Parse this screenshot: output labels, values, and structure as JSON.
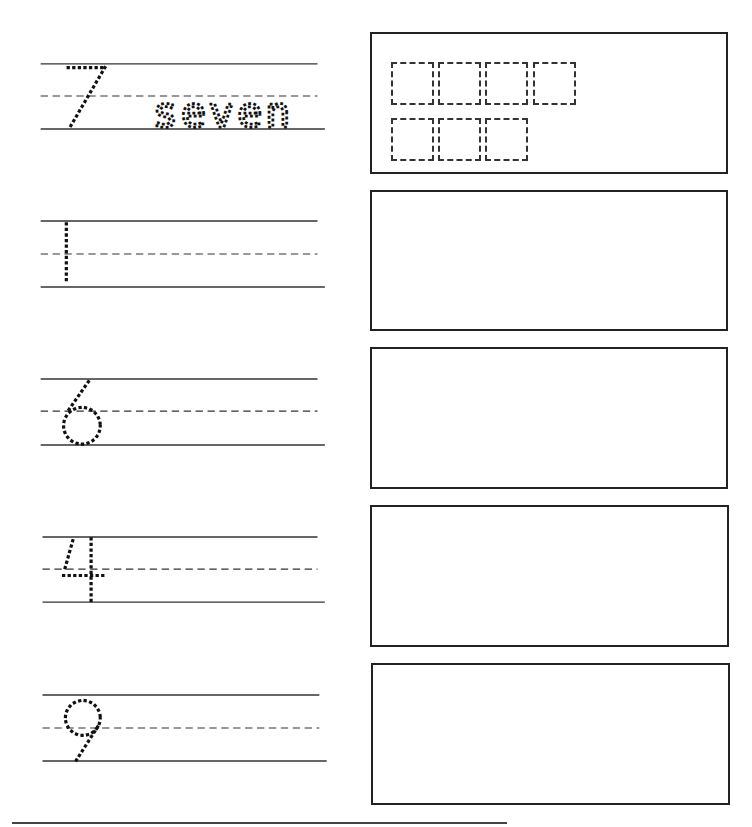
{
  "worksheet": {
    "rows": [
      {
        "numeral": "7",
        "word": "seven",
        "counters_shown": 7,
        "counter_rows": [
          4,
          3
        ]
      },
      {
        "numeral": "1",
        "word": "",
        "counters_shown": 0
      },
      {
        "numeral": "6",
        "word": "",
        "counters_shown": 0
      },
      {
        "numeral": "4",
        "word": "",
        "counters_shown": 0
      },
      {
        "numeral": "9",
        "word": "",
        "counters_shown": 0
      }
    ],
    "colors": {
      "ink": "#222222",
      "page": "#ffffff"
    }
  }
}
